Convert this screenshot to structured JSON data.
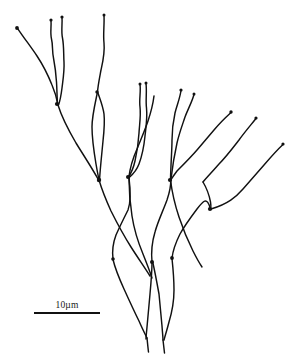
{
  "figure": {
    "kind": "scientific-line-drawing",
    "subject_description": "Branching filamentous thallus, hand-inked outline drawing",
    "background_color": "#ffffff",
    "ink_color": "#111111",
    "canvas": {
      "width": 292,
      "height": 358
    }
  },
  "scale_bar": {
    "label": "10µm",
    "value": 10,
    "unit": "µm",
    "bar_length_px": 66,
    "bar_color": "#111111",
    "position": {
      "x": 34,
      "y": 300
    }
  },
  "drawing": {
    "stroke_color": "#111111",
    "stroke_width": 1.45,
    "tip_dots": [
      {
        "cx": 17,
        "cy": 28,
        "r": 1.9
      },
      {
        "cx": 51,
        "cy": 20,
        "r": 1.6
      },
      {
        "cx": 62,
        "cy": 17,
        "r": 1.6
      },
      {
        "cx": 104,
        "cy": 15,
        "r": 1.5
      },
      {
        "cx": 97,
        "cy": 92,
        "r": 1.7
      },
      {
        "cx": 140,
        "cy": 84,
        "r": 1.5
      },
      {
        "cx": 146,
        "cy": 83,
        "r": 1.5
      },
      {
        "cx": 181,
        "cy": 90,
        "r": 1.6
      },
      {
        "cx": 194,
        "cy": 94,
        "r": 1.5
      },
      {
        "cx": 231,
        "cy": 112,
        "r": 1.7
      },
      {
        "cx": 256,
        "cy": 118,
        "r": 1.6
      },
      {
        "cx": 283,
        "cy": 144,
        "r": 1.6
      },
      {
        "cx": 57,
        "cy": 104,
        "r": 2.1
      },
      {
        "cx": 99,
        "cy": 180,
        "r": 2.2
      },
      {
        "cx": 128,
        "cy": 177,
        "r": 2.0
      },
      {
        "cx": 170,
        "cy": 180,
        "r": 2.1
      },
      {
        "cx": 210,
        "cy": 209,
        "r": 2.1
      },
      {
        "cx": 113,
        "cy": 259,
        "r": 1.8
      },
      {
        "cx": 152,
        "cy": 262,
        "r": 2.0
      },
      {
        "cx": 172,
        "cy": 258,
        "r": 1.9
      }
    ],
    "paths": [
      {
        "name": "branch-upper-left-long",
        "d": "M17.5,28.3 C24,38 31,47 37,56 C43,65 48,75 52,85 C55,92 57,99 58,105"
      },
      {
        "name": "branch-left-axis-down",
        "d": "M58,105 C62,118 69,131 76,143 C84,156 92,168 98,179"
      },
      {
        "name": "branch-left-upper-a",
        "d": "M51,20.5 C51.5,27 50,33 51.5,39 C53,45 52,51 53.5,58 C55,66 56,74 56.5,82 C57,90 57,97 57.5,104"
      },
      {
        "name": "branch-left-upper-b",
        "d": "M62,17.5 C62.5,24 61,31 62.5,38 C64,46 63.5,54 64,62 C64.5,71 63,80 62,88 C61,96 60,101 58.5,105"
      },
      {
        "name": "branch-mid-upper-long",
        "d": "M104,15.5 C104.5,25 103,34 104,43 C105,53 103,61 101,70 C99.5,78 98,85 97.5,92"
      },
      {
        "name": "branch-mid-to-junction",
        "d": "M97.5,92 C95,104 92,116 92,127 C92,139 94,152 96,164 C97.5,173 98.5,177 99,180"
      },
      {
        "name": "branch-mid-left-hook",
        "d": "M97.8,92.5 C100,99 103,106 104,114 C105,123 104,132 103,141 C102,152 100.5,165 99.5,180"
      },
      {
        "name": "branch-center-upper-a",
        "d": "M140,84.5 C141,92 139,99 140,107 C141,116 139.5,124 139,133 C138.5,142 137,152 135,161 C133,170 130.5,174 128.5,177"
      },
      {
        "name": "branch-center-upper-b",
        "d": "M146,83.5 C147,92 145.5,100 146.5,108 C147.5,118 146,127 145,136 C144,146 142,156 139,164 C136,172 132,175 129,177.5"
      },
      {
        "name": "branch-center-vstem",
        "d": "M128.8,177.5 C130,168 133,158 137,149 C141,139 145,130 148,121 C151,112 153,104 154,96"
      },
      {
        "name": "branch-right-upper-a",
        "d": "M181,90.5 C180,98 177,105 175,113 C173,122 172,131 172,140 C172,150 171,160 170.5,179.5"
      },
      {
        "name": "branch-right-upper-b",
        "d": "M194,94.5 C192,102 188,109 185,117 C182,126 179,134 177,143 C175,152 173,162 171,179"
      },
      {
        "name": "branch-right-arc-upper",
        "d": "M231,112.5 C225,118 219,124 214,130 C208,137 203,143 197,150 C191,157 184,164 177,171 C174,175 172,178 170.8,180"
      },
      {
        "name": "branch-right-arc-mid",
        "d": "M256,118.5 C250,126 244,133 239,140 C232,149 226,157 219,164 C213,171 207,177 203,182"
      },
      {
        "name": "branch-right-arc-lower",
        "d": "M283,144.5 C276,151 270,158 264,165 C257,173 250,181 243,189 C236,197 228,204 211,209"
      },
      {
        "name": "branch-right-connector",
        "d": "M203,182 C206,187 209,194 210.5,202 C211,205 211,207 210.8,209"
      },
      {
        "name": "leaf-left-outer",
        "d": "M99,180 C102,190 106,200 111,211 C117,223 124,236 131,247 C138,258 145,268 150,276"
      },
      {
        "name": "leaf-left-inner",
        "d": "M113,259 C112,251 113,243 116,235 C120,226 124,218 128,210 C131,202 130.5,190 129,177.8"
      },
      {
        "name": "leaf-center-left",
        "d": "M129,178 C129,190 130,203 132,216 C134,229 138,242 143,254 C147,264 150,272 152,278"
      },
      {
        "name": "leaf-center-right",
        "d": "M152,262 C151,252 152,242 155,232 C158,221 163,211 167,200 C170,191 171,185 170.7,180"
      },
      {
        "name": "leaf-right-outer",
        "d": "M170.5,180 C172,192 175,205 179,217 C183,229 188,241 193,251 C197,259 200,264 202,267"
      },
      {
        "name": "leaf-right-inner",
        "d": "M172,258 C173,250 176,242 180,234 C185,225 191,217 197,209 C203,201 207,196 210.5,209"
      },
      {
        "name": "rosette-left-prong",
        "d": "M113,259.5 C115,268 119,278 124,289 C129,300 134,311 139,321 C142,328 145,334 147,338"
      },
      {
        "name": "rosette-center-left-prong",
        "d": "M152,262.5 C152,272 151,283 150,294 C149,306 148,317 147,327 C146.5,333 146,336 146,339"
      },
      {
        "name": "rosette-center-right-prong",
        "d": "M152.8,262.5 C155,272 157,283 159,294 C160,305 161,316 162,326 C162.5,333 163,337 163,340"
      },
      {
        "name": "rosette-right-prong",
        "d": "M172,258.5 C173,268 174,279 174,290 C174,301 172,312 169,322 C167,330 165,336 164,340"
      },
      {
        "name": "stalk-left-fine",
        "d": "M147,338 C147.5,343 148,348 148.5,352"
      },
      {
        "name": "stalk-right-fine",
        "d": "M163,340 C163.5,344 164,349 164.5,353"
      }
    ]
  }
}
